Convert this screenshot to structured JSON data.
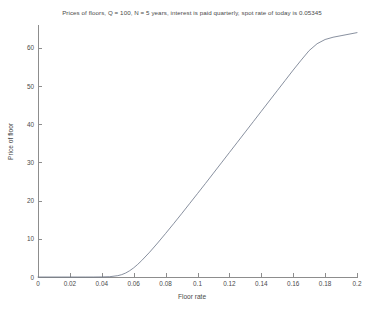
{
  "chart_data": {
    "type": "line",
    "title": "Prices of floors, Q = 100, N = 5 years, interest is paid quarterly, spot rate of today is 0.05345",
    "xlabel": "Floor rate",
    "ylabel": "Price of floor",
    "xlim": [
      0,
      0.2
    ],
    "ylim": [
      0,
      66
    ],
    "grid": false,
    "legend": null,
    "xticks": [
      0,
      0.02,
      0.04,
      0.06,
      0.08,
      0.1,
      0.12,
      0.14,
      0.16,
      0.18,
      0.2
    ],
    "xtick_labels": [
      "0",
      "0.02",
      "0.04",
      "0.06",
      "0.08",
      "0.1",
      "0.12",
      "0.14",
      "0.16",
      "0.18",
      "0.2"
    ],
    "yticks": [
      0,
      10,
      20,
      30,
      40,
      50,
      60
    ],
    "ytick_labels": [
      "0",
      "10",
      "20",
      "30",
      "40",
      "50",
      "60"
    ],
    "line_color": "#6a7486",
    "series": [
      {
        "name": "Price of floor",
        "x": [
          0,
          0.005,
          0.01,
          0.015,
          0.02,
          0.025,
          0.03,
          0.035,
          0.04,
          0.045,
          0.05,
          0.0525,
          0.055,
          0.0575,
          0.06,
          0.0625,
          0.065,
          0.07,
          0.075,
          0.08,
          0.085,
          0.09,
          0.095,
          0.1,
          0.105,
          0.11,
          0.115,
          0.12,
          0.125,
          0.13,
          0.135,
          0.14,
          0.145,
          0.15,
          0.155,
          0.16,
          0.165,
          0.17,
          0.175,
          0.18,
          0.185,
          0.19,
          0.195,
          0.2
        ],
        "y": [
          0,
          0,
          0,
          0,
          0,
          0,
          0,
          0,
          0.02,
          0.08,
          0.35,
          0.62,
          1.05,
          1.65,
          2.4,
          3.3,
          4.3,
          6.5,
          8.9,
          11.4,
          13.95,
          16.55,
          19.2,
          21.85,
          24.5,
          27.2,
          29.9,
          32.6,
          35.3,
          38.0,
          40.7,
          43.4,
          46.1,
          48.8,
          51.5,
          54.2,
          56.8,
          59.3,
          61.1,
          62.2,
          62.8,
          63.2,
          63.6,
          64.0
        ]
      }
    ]
  }
}
